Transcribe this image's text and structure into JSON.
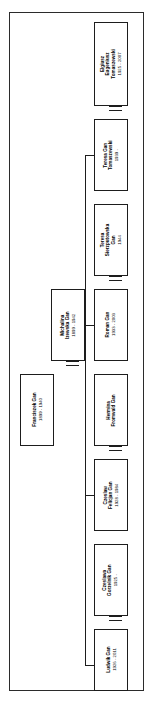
{
  "document": {
    "kind": "family-tree-chart",
    "orientation": "rotated-90-ccw",
    "frame_color": "#2b2b2b",
    "line_color": "#1d1d1d",
    "background": "#ffffff"
  },
  "people": [
    {
      "id": "elgiusz",
      "name": "Elgiusz\nEugeniusz\nTomaszewski",
      "name_line1": "Elgiusz",
      "name_line2": "Eugeniusz",
      "name_line3": "Tomaszewski",
      "dates": "1925 - 2007"
    },
    {
      "id": "teresa-gan-tomaszewski",
      "name_line1": "Teresa Gan",
      "name_line2": "Tomaszewski",
      "name_line3": "",
      "dates": "1939 -"
    },
    {
      "id": "teresa-sierzputowska",
      "name_line1": "Teresa",
      "name_line2": "Sierzputowska",
      "name_line3": "Gan",
      "dates": "1944"
    },
    {
      "id": "roman-gan",
      "name_line1": "Roman Gan",
      "name_line2": "",
      "name_line3": "",
      "dates": "1933 - 2003"
    },
    {
      "id": "hermina-fromwald",
      "name_line1": "Hermina",
      "name_line2": "Fromwald Gan",
      "name_line3": "",
      "dates": ""
    },
    {
      "id": "czeslaw-felicjan",
      "name_line1": "Czeslaw",
      "name_line2": "Felicjan Gan",
      "name_line3": "",
      "dates": "1928 - 1984"
    },
    {
      "id": "czeslawa-gorzelnik",
      "name_line1": "Czeslawa",
      "name_line2": "Gorzelnik Gan",
      "name_line3": "",
      "dates": "1925 -"
    },
    {
      "id": "ludwik-gan",
      "name_line1": "Ludwik Gan",
      "name_line2": "",
      "name_line3": "",
      "dates": "1926 - 2011"
    },
    {
      "id": "michalina-izewska",
      "name_line1": "Michalina",
      "name_line2": "Izewska Gan",
      "name_line3": "",
      "dates": "1899 - 1942"
    },
    {
      "id": "franciszek-gan",
      "name_line1": "Franciszek Gan",
      "name_line2": "",
      "name_line3": "",
      "dates": "1899 - 1940"
    }
  ]
}
